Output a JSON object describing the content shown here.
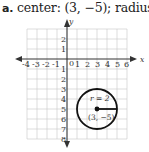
{
  "caption": {
    "letter": "a.",
    "text": "center: (3, −5); radius: 2"
  },
  "graph": {
    "x_axis_label": "x",
    "y_axis_label": "y",
    "x_ticks": [
      "-4",
      "-3",
      "-2",
      "-1",
      "0",
      "1",
      "2",
      "3",
      "4",
      "5",
      "6"
    ],
    "y_ticks_positive": [
      "1",
      "2"
    ],
    "y_ticks_negative": [
      "1",
      "2",
      "3",
      "4",
      "5",
      "6",
      "7",
      "8"
    ],
    "x_range": [
      -4,
      6
    ],
    "y_range": [
      -8,
      3
    ],
    "grid": true
  },
  "circle": {
    "center": [
      3,
      -5
    ],
    "radius": 2,
    "radius_label": "r = 2",
    "center_label": "(3, −5)"
  },
  "colors": {
    "grid": "#c8c8c8",
    "axis": "#333333",
    "circle": "#111111"
  }
}
